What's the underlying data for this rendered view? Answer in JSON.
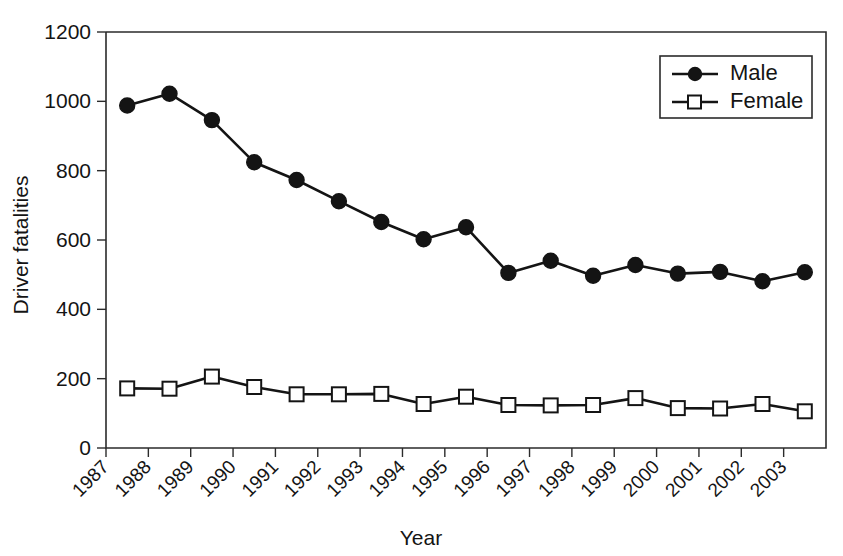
{
  "chart_data": {
    "type": "line",
    "title": "",
    "xlabel": "Year",
    "ylabel": "Driver fatalities",
    "xlim": [
      1987,
      2004
    ],
    "ylim": [
      0,
      1200
    ],
    "yticks": [
      0,
      200,
      400,
      600,
      800,
      1000,
      1200
    ],
    "grid": false,
    "legend_position": "top-right",
    "categories": [
      "1987",
      "1988",
      "1989",
      "1990",
      "1991",
      "1992",
      "1993",
      "1994",
      "1995",
      "1996",
      "1997",
      "1998",
      "1999",
      "2000",
      "2001",
      "2002",
      "2003"
    ],
    "x": [
      1987.5,
      1988.5,
      1989.5,
      1990.5,
      1991.5,
      1992.5,
      1993.5,
      1994.5,
      1995.5,
      1996.5,
      1997.5,
      1998.5,
      1999.5,
      2000.5,
      2001.5,
      2002.5,
      2003.5
    ],
    "series": [
      {
        "name": "Male",
        "marker": "filled-circle",
        "color": "#141414",
        "values": [
          988,
          1022,
          946,
          824,
          773,
          712,
          652,
          602,
          637,
          505,
          540,
          497,
          528,
          503,
          508,
          481,
          507
        ]
      },
      {
        "name": "Female",
        "marker": "open-square",
        "color": "#141414",
        "values": [
          172,
          171,
          206,
          176,
          155,
          155,
          156,
          127,
          148,
          124,
          123,
          124,
          144,
          115,
          114,
          127,
          106
        ]
      }
    ]
  },
  "legend": {
    "entries": [
      {
        "label": "Male"
      },
      {
        "label": "Female"
      }
    ]
  },
  "axes": {
    "x_title": "Year",
    "y_title": "Driver fatalities"
  }
}
